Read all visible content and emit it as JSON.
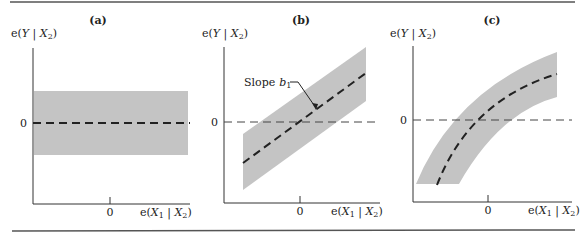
{
  "figure": {
    "panels": [
      {
        "id": "a",
        "title": "(a)",
        "y_label": {
          "prefix": "e(",
          "var": "Y",
          "sep": " | ",
          "cond": "X",
          "sub": "2",
          "suffix": ")"
        },
        "x_label": {
          "prefix": "e(",
          "var": "X",
          "var_sub": "1",
          "sep": " | ",
          "cond": "X",
          "sub": "2",
          "suffix": ")"
        },
        "y_zero_label": "0",
        "x_zero_label": "0",
        "description": "horizontal gray band centered on zero with horizontal dashed line at 0"
      },
      {
        "id": "b",
        "title": "(b)",
        "y_label": {
          "prefix": "e(",
          "var": "Y",
          "sep": " | ",
          "cond": "X",
          "sub": "2",
          "suffix": ")"
        },
        "x_label": {
          "prefix": "e(",
          "var": "X",
          "var_sub": "1",
          "sep": " | ",
          "cond": "X",
          "sub": "2",
          "suffix": ")"
        },
        "y_zero_label": "0",
        "x_zero_label": "0",
        "annotation": {
          "text": "Slope",
          "symbol": "b",
          "symbol_sub": "1"
        },
        "description": "linear upward-sloping gray band with dashed line of slope b1 through origin"
      },
      {
        "id": "c",
        "title": "(c)",
        "y_label": {
          "prefix": "e(",
          "var": "Y",
          "sep": " | ",
          "cond": "X",
          "sub": "2",
          "suffix": ")"
        },
        "x_label": {
          "prefix": "e(",
          "var": "X",
          "var_sub": "1",
          "sep": " | ",
          "cond": "X",
          "sub": "2",
          "suffix": ")"
        },
        "y_zero_label": "0",
        "x_zero_label": "0",
        "description": "concave curved gray band with dashed curve through origin"
      }
    ],
    "colors": {
      "band": "#c4c4c4",
      "ink": "#222222",
      "rule": "#555555"
    }
  }
}
